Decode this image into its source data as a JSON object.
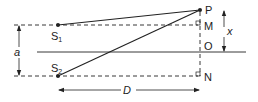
{
  "diagram": {
    "points": {
      "S1": {
        "label": "S",
        "sub": "1"
      },
      "S2": {
        "label": "S",
        "sub": "2"
      },
      "P": {
        "label": "P"
      },
      "M": {
        "label": "M"
      },
      "O": {
        "label": "O"
      },
      "N": {
        "label": "N"
      }
    },
    "dimensions": {
      "a": "a",
      "x": "x",
      "D": "D"
    },
    "colors": {
      "line": "#222222",
      "background": "#ffffff"
    }
  }
}
